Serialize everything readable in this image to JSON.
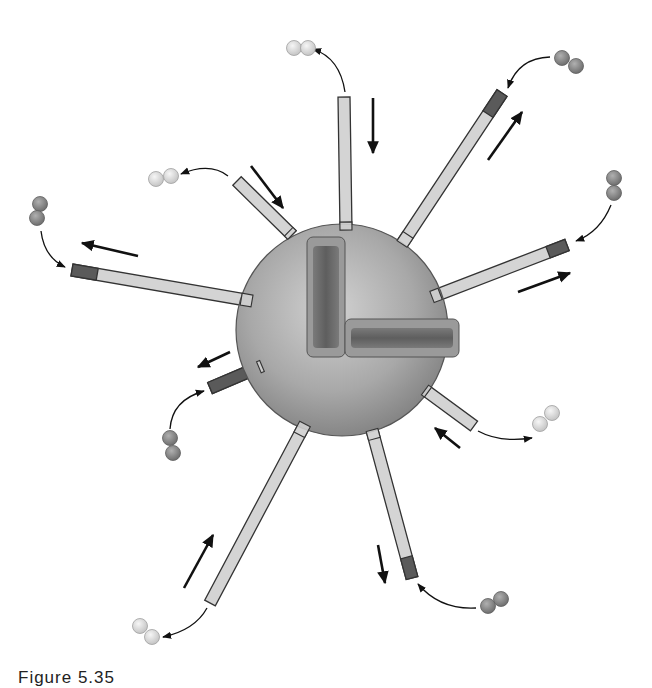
{
  "figure": {
    "colors": {
      "background": "#ffffff",
      "sphere_light": "#c9c9c9",
      "sphere_dark": "#8a8a8a",
      "sphere_edge": "#555555",
      "rod_fill": "#d4d4d4",
      "rod_edge": "#333333",
      "cap_dark": "#5a5a5a",
      "inner_block": "#6e6e6e",
      "dimer_light": "#e2e2e2",
      "dimer_dark": "#8c8c8c",
      "arrow": "#111111"
    },
    "sphere": {
      "cx": 342,
      "cy": 330,
      "r": 106
    },
    "inner_blocks": [
      {
        "name": "vertical-block",
        "x": 310,
        "y": 240,
        "w": 32,
        "h": 114
      },
      {
        "name": "horizontal-block",
        "x": 348,
        "y": 322,
        "w": 108,
        "h": 32
      }
    ],
    "rods": [
      {
        "id": "rod-top",
        "x1": 346,
        "y1": 230,
        "x2": 344,
        "y2": 97,
        "width": 12,
        "cap": false,
        "state": "shrinking"
      },
      {
        "id": "rod-top-right",
        "x1": 402,
        "y1": 244,
        "x2": 502,
        "y2": 93,
        "width": 12,
        "cap": true,
        "state": "growing"
      },
      {
        "id": "rod-upper-left",
        "x1": 292,
        "y1": 235,
        "x2": 237,
        "y2": 181,
        "width": 12,
        "cap": false,
        "state": "shrinking"
      },
      {
        "id": "rod-left",
        "x1": 252,
        "y1": 301,
        "x2": 72,
        "y2": 270,
        "width": 12,
        "cap": true,
        "state": "growing"
      },
      {
        "id": "rod-right",
        "x1": 432,
        "y1": 297,
        "x2": 567,
        "y2": 245,
        "width": 12,
        "cap": true,
        "state": "growing"
      },
      {
        "id": "rod-lower-left-short",
        "x1": 262,
        "y1": 366,
        "x2": 210,
        "y2": 388,
        "width": 12,
        "cap": true,
        "state": "growing",
        "full_cap": true
      },
      {
        "id": "rod-lower-right-short",
        "x1": 425,
        "y1": 390,
        "x2": 474,
        "y2": 426,
        "width": 12,
        "cap": false,
        "state": "shrinking"
      },
      {
        "id": "rod-bottom-left",
        "x1": 305,
        "y1": 424,
        "x2": 210,
        "y2": 603,
        "width": 12,
        "cap": false,
        "state": "shrinking"
      },
      {
        "id": "rod-bottom",
        "x1": 372,
        "y1": 430,
        "x2": 412,
        "y2": 578,
        "width": 12,
        "cap": true,
        "state": "growing"
      }
    ],
    "dimers": [
      {
        "id": "dimer-top",
        "type": "light",
        "a": [
          294,
          48
        ],
        "b": [
          308,
          48
        ]
      },
      {
        "id": "dimer-upper-left",
        "type": "light",
        "a": [
          156,
          179
        ],
        "b": [
          171,
          176
        ]
      },
      {
        "id": "dimer-top-right",
        "type": "dark",
        "a": [
          562,
          58
        ],
        "b": [
          576,
          66
        ]
      },
      {
        "id": "dimer-left",
        "type": "dark",
        "a": [
          40,
          204
        ],
        "b": [
          37,
          218
        ]
      },
      {
        "id": "dimer-right",
        "type": "dark",
        "a": [
          614,
          178
        ],
        "b": [
          614,
          193
        ]
      },
      {
        "id": "dimer-lower-left",
        "type": "dark",
        "a": [
          170,
          438
        ],
        "b": [
          173,
          453
        ]
      },
      {
        "id": "dimer-lower-right",
        "type": "light",
        "a": [
          552,
          413
        ],
        "b": [
          540,
          424
        ]
      },
      {
        "id": "dimer-bottom-right",
        "type": "dark",
        "a": [
          488,
          606
        ],
        "b": [
          501,
          599
        ]
      },
      {
        "id": "dimer-bottom-left",
        "type": "light",
        "a": [
          140,
          626
        ],
        "b": [
          152,
          637
        ]
      }
    ],
    "curved_arrows": [
      {
        "id": "curve-top",
        "d": "M 345 92 Q 340 58 313 49"
      },
      {
        "id": "curve-upper-left",
        "d": "M 228 176 Q 210 162 181 174"
      },
      {
        "id": "curve-top-right",
        "d": "M 550 57 Q 518 58 508 88"
      },
      {
        "id": "curve-left",
        "d": "M 41 231 Q 44 257 65 267"
      },
      {
        "id": "curve-right",
        "d": "M 611 205 Q 600 232 576 241"
      },
      {
        "id": "curve-lower-left",
        "d": "M 170 429 Q 172 400 204 391"
      },
      {
        "id": "curve-lower-right",
        "d": "M 478 431 Q 500 443 532 438"
      },
      {
        "id": "curve-bottom-right",
        "d": "M 476 608 Q 440 610 418 584"
      },
      {
        "id": "curve-bottom-left",
        "d": "M 207 608 Q 195 630 163 637"
      }
    ],
    "straight_arrows": [
      {
        "id": "arrow-top",
        "x1": 373,
        "y1": 98,
        "x2": 373,
        "y2": 153
      },
      {
        "id": "arrow-upper-left",
        "x1": 251,
        "y1": 166,
        "x2": 283,
        "y2": 208
      },
      {
        "id": "arrow-top-right",
        "x1": 488,
        "y1": 160,
        "x2": 522,
        "y2": 112
      },
      {
        "id": "arrow-left",
        "x1": 138,
        "y1": 256,
        "x2": 82,
        "y2": 243
      },
      {
        "id": "arrow-right",
        "x1": 518,
        "y1": 292,
        "x2": 570,
        "y2": 273
      },
      {
        "id": "arrow-lower-left",
        "x1": 230,
        "y1": 352,
        "x2": 198,
        "y2": 367
      },
      {
        "id": "arrow-lower-right",
        "x1": 460,
        "y1": 448,
        "x2": 435,
        "y2": 428
      },
      {
        "id": "arrow-bottom",
        "x1": 378,
        "y1": 545,
        "x2": 385,
        "y2": 583
      },
      {
        "id": "arrow-bottom-left",
        "x1": 184,
        "y1": 588,
        "x2": 213,
        "y2": 535
      }
    ]
  },
  "caption": {
    "text": "Figure 5.35"
  }
}
